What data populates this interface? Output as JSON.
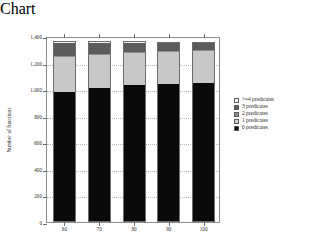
{
  "chart_data": {
    "type": "bar",
    "title": "",
    "xlabel": "confidence",
    "ylabel": "Number of functions",
    "categories": [
      "60",
      "70",
      "80",
      "90",
      "100"
    ],
    "stacked": true,
    "ylim": [
      0,
      1400
    ],
    "y_ticks": [
      0,
      200,
      400,
      600,
      800,
      1000,
      1200,
      1400
    ],
    "y_tick_labels": [
      "0",
      "200",
      "400",
      "600",
      "800",
      "1,000",
      "1,200",
      "1,400"
    ],
    "grid": true,
    "legend_position": "right",
    "series": [
      {
        "name": "0 predicates",
        "color": "#0a0a0a",
        "values": [
          980,
          1010,
          1030,
          1040,
          1045
        ]
      },
      {
        "name": "1 predicates",
        "color": "#c8c8c8",
        "values": [
          265,
          250,
          245,
          240,
          240
        ]
      },
      {
        "name": "2 predicates",
        "color": "#8f8f8f",
        "values": [
          8,
          8,
          8,
          8,
          8
        ]
      },
      {
        "name": "3 predicates",
        "color": "#5c5c5c",
        "values": [
          97,
          82,
          67,
          57,
          52
        ]
      },
      {
        "name": ">=4 predicates",
        "color": "#f2f2f2",
        "values": [
          10,
          10,
          10,
          10,
          10
        ]
      }
    ]
  },
  "legend": {
    "items": [
      {
        "label": ">=4 predicates",
        "swatch": "sw4"
      },
      {
        "label": "3 predicates",
        "swatch": "sw3"
      },
      {
        "label": "2 predicates",
        "swatch": "sw2"
      },
      {
        "label": "1 predicates",
        "swatch": "sw1"
      },
      {
        "label": "0 predicates",
        "swatch": "sw0"
      }
    ]
  }
}
